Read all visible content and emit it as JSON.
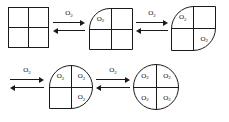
{
  "diagram": {
    "ligand_label": "O",
    "ligand_subscript": "2",
    "line_color": "#1a1a1a",
    "background_color": "#ffffff",
    "states": [
      {
        "id": "state-0",
        "name": "deoxyhemoglobin-tetramer",
        "bound_oxygen_count": 0,
        "shape": "square",
        "rounded_corners": [],
        "quadrants": {
          "top_left": "",
          "top_right": "",
          "bottom_left": "",
          "bottom_right": ""
        },
        "x": 8,
        "y": 7,
        "w": 41,
        "h": 41
      },
      {
        "id": "state-1",
        "name": "hemoglobin-one-oxygen",
        "bound_oxygen_count": 1,
        "shape": "square-one-rounded-corner",
        "rounded_corners": [
          "top_left"
        ],
        "quadrants": {
          "top_left": "O2",
          "top_right": "",
          "bottom_left": "",
          "bottom_right": ""
        },
        "x": 89,
        "y": 8,
        "w": 44,
        "h": 42
      },
      {
        "id": "state-2",
        "name": "hemoglobin-two-oxygen",
        "bound_oxygen_count": 2,
        "shape": "square-two-rounded-corners",
        "rounded_corners": [
          "top_left",
          "bottom_right"
        ],
        "quadrants": {
          "top_left": "O2",
          "top_right": "",
          "bottom_left": "",
          "bottom_right": "O2"
        },
        "x": 171,
        "y": 6,
        "w": 45,
        "h": 45
      },
      {
        "id": "state-3",
        "name": "hemoglobin-three-oxygen",
        "bound_oxygen_count": 3,
        "shape": "square-three-rounded-corners",
        "rounded_corners": [
          "top_left",
          "top_right",
          "bottom_right"
        ],
        "quadrants": {
          "top_left": "O2",
          "top_right": "O2",
          "bottom_left": "",
          "bottom_right": "O2"
        },
        "x": 49,
        "y": 65,
        "w": 44,
        "h": 44
      },
      {
        "id": "state-4",
        "name": "oxyhemoglobin-four-oxygen",
        "bound_oxygen_count": 4,
        "shape": "circle",
        "rounded_corners": [
          "top_left",
          "top_right",
          "bottom_left",
          "bottom_right"
        ],
        "quadrants": {
          "top_left": "O2",
          "top_right": "O2",
          "bottom_left": "O2",
          "bottom_right": "O2"
        },
        "x": 133,
        "y": 64,
        "w": 46,
        "h": 46
      }
    ],
    "arrows": [
      {
        "id": "arrow-0",
        "name": "equilibrium-arrows-step-1",
        "label": "O",
        "label_subscript": "2",
        "x": 53,
        "y": 10,
        "w": 32
      },
      {
        "id": "arrow-1",
        "name": "equilibrium-arrows-step-2",
        "label": "O",
        "label_subscript": "2",
        "x": 136,
        "y": 10,
        "w": 32
      },
      {
        "id": "arrow-2",
        "name": "equilibrium-arrows-step-3",
        "label": "O",
        "label_subscript": "2",
        "x": 10,
        "y": 67,
        "w": 34
      },
      {
        "id": "arrow-3",
        "name": "equilibrium-arrows-step-4",
        "label": "O",
        "label_subscript": "2",
        "x": 96,
        "y": 67,
        "w": 34
      }
    ]
  }
}
